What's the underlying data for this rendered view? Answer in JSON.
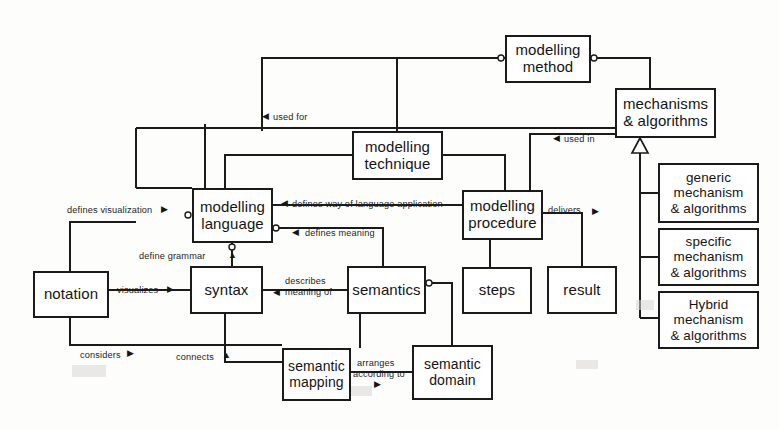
{
  "diagram": {
    "type": "block-relationship-diagram",
    "colors": {
      "box_border": "#1b1b1b",
      "box_fill": "#ffffff",
      "line": "#1b1b1b",
      "background": "#fdfdfc"
    },
    "nodes": [
      {
        "id": "modelling-method",
        "lines": [
          "modelling",
          "method"
        ]
      },
      {
        "id": "mechanisms-algorithms",
        "lines": [
          "mechanisms",
          "& algorithms"
        ]
      },
      {
        "id": "modelling-technique",
        "lines": [
          "modelling",
          "technique"
        ]
      },
      {
        "id": "modelling-language",
        "lines": [
          "modelling",
          "language"
        ]
      },
      {
        "id": "modelling-procedure",
        "lines": [
          "modelling",
          "procedure"
        ]
      },
      {
        "id": "generic-mechanism",
        "lines": [
          "generic",
          "mechanism",
          "& algorithms"
        ]
      },
      {
        "id": "specific-mechanism",
        "lines": [
          "specific",
          "mechanism",
          "& algorithms"
        ]
      },
      {
        "id": "hybrid-mechanism",
        "lines": [
          "Hybrid",
          "mechanism",
          "& algorithms"
        ]
      },
      {
        "id": "notation",
        "lines": [
          "notation"
        ]
      },
      {
        "id": "syntax",
        "lines": [
          "syntax"
        ]
      },
      {
        "id": "semantics",
        "lines": [
          "semantics"
        ]
      },
      {
        "id": "steps",
        "lines": [
          "steps"
        ]
      },
      {
        "id": "result",
        "lines": [
          "result"
        ]
      },
      {
        "id": "semantic-mapping",
        "lines": [
          "semantic",
          "mapping"
        ]
      },
      {
        "id": "semantic-domain",
        "lines": [
          "semantic",
          "domain"
        ]
      }
    ],
    "edge_labels": [
      {
        "id": "used-for",
        "text": "used for",
        "arrow": "left"
      },
      {
        "id": "used-in",
        "text": "used in",
        "arrow": "left"
      },
      {
        "id": "defines-visualization",
        "text": "defines visualization",
        "arrow": "right"
      },
      {
        "id": "defines-way-of-language-application",
        "text": "defines way of language application",
        "arrow": "left"
      },
      {
        "id": "defines-meaning",
        "text": "defines meaning",
        "arrow": "left"
      },
      {
        "id": "define-grammar",
        "text": "define grammar",
        "arrow": "none"
      },
      {
        "id": "visualizes",
        "text": "visualizes",
        "arrow": "right"
      },
      {
        "id": "describes-meaning-of",
        "text_line1": "describes",
        "text_line2": "meaning of",
        "arrow": "left"
      },
      {
        "id": "delivers",
        "text": "delivers",
        "arrow": "right"
      },
      {
        "id": "considers",
        "text": "considers",
        "arrow": "right"
      },
      {
        "id": "connects",
        "text": "connects",
        "arrow": "up"
      },
      {
        "id": "arranges-according-to",
        "text_line1": "arranges",
        "text_line2": "according to",
        "arrow": "right"
      }
    ]
  }
}
